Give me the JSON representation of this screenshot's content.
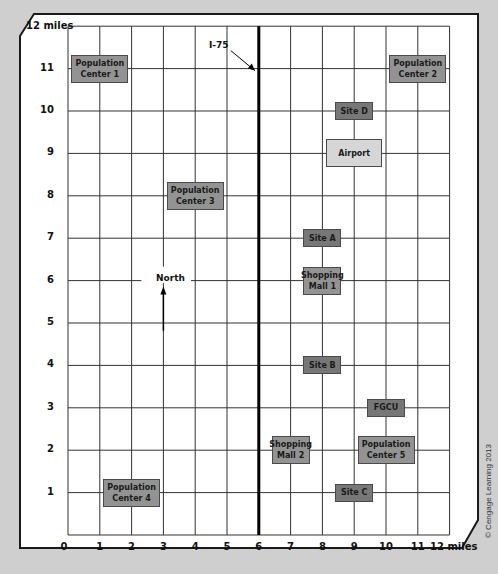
{
  "map": {
    "x_axis": {
      "min": 0,
      "max": 12,
      "tick_labels": [
        "0",
        "1",
        "2",
        "3",
        "4",
        "5",
        "6",
        "7",
        "8",
        "9",
        "10",
        "11"
      ],
      "end_label": "12 miles"
    },
    "y_axis": {
      "min": 0,
      "max": 12,
      "tick_labels": [
        "1",
        "2",
        "3",
        "4",
        "5",
        "6",
        "7",
        "8",
        "9",
        "10",
        "11"
      ],
      "end_label": "12 miles"
    },
    "highway": {
      "label": "I-75",
      "x": 6
    },
    "north": {
      "label": "North",
      "x": 3,
      "y": 6
    },
    "places": [
      {
        "id": "population-center-1",
        "label": [
          "Population",
          "Center 1"
        ],
        "x": 1,
        "y": 11,
        "kind": "pop"
      },
      {
        "id": "population-center-2",
        "label": [
          "Population",
          "Center 2"
        ],
        "x": 11,
        "y": 11,
        "kind": "pop"
      },
      {
        "id": "population-center-3",
        "label": [
          "Population",
          "Center 3"
        ],
        "x": 4,
        "y": 8,
        "kind": "pop"
      },
      {
        "id": "population-center-4",
        "label": [
          "Population",
          "Center 4"
        ],
        "x": 2,
        "y": 1,
        "kind": "pop"
      },
      {
        "id": "population-center-5",
        "label": [
          "Population",
          "Center 5"
        ],
        "x": 10,
        "y": 2,
        "kind": "pop"
      },
      {
        "id": "site-a",
        "label": [
          "Site A"
        ],
        "x": 8,
        "y": 7,
        "kind": "site"
      },
      {
        "id": "site-b",
        "label": [
          "Site B"
        ],
        "x": 8,
        "y": 4,
        "kind": "site"
      },
      {
        "id": "site-c",
        "label": [
          "Site C"
        ],
        "x": 9,
        "y": 1,
        "kind": "site"
      },
      {
        "id": "site-d",
        "label": [
          "Site D"
        ],
        "x": 9,
        "y": 10,
        "kind": "site"
      },
      {
        "id": "shopping-mall-1",
        "label": [
          "Shopping",
          "Mall 1"
        ],
        "x": 8,
        "y": 6,
        "kind": "pop"
      },
      {
        "id": "shopping-mall-2",
        "label": [
          "Shopping",
          "Mall 2"
        ],
        "x": 7,
        "y": 2,
        "kind": "pop"
      },
      {
        "id": "airport",
        "label": [
          "Airport"
        ],
        "x": 9,
        "y": 9,
        "kind": "light"
      },
      {
        "id": "fgcu",
        "label": [
          "FGCU"
        ],
        "x": 10,
        "y": 3,
        "kind": "site"
      }
    ],
    "colors": {
      "population": "#939393",
      "site": "#777777",
      "airport": "#d6d6d6",
      "grid": "#333333",
      "background": "#cfcfcf"
    }
  },
  "copyright": "© Cengage Learning 2013"
}
